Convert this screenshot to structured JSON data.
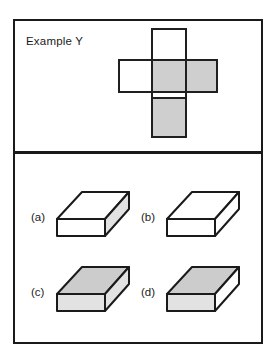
{
  "figure": {
    "title": "Example Y",
    "panels": {
      "top_label": "Example Y"
    }
  },
  "net": {
    "description": "unfolded-box-net",
    "faces": [
      {
        "id": "top-flap",
        "shade": "white",
        "x": 33,
        "y": 0,
        "w": 36,
        "h": 33
      },
      {
        "id": "left-flap",
        "shade": "white",
        "x": 0,
        "y": 31,
        "w": 36,
        "h": 33
      },
      {
        "id": "center-face",
        "shade": "gray",
        "x": 33,
        "y": 31,
        "w": 36,
        "h": 33
      },
      {
        "id": "right-flap",
        "shade": "gray",
        "x": 66,
        "y": 31,
        "w": 34,
        "h": 33
      },
      {
        "id": "bottom-face",
        "shade": "gray",
        "x": 33,
        "y": 69,
        "w": 36,
        "h": 41
      }
    ]
  },
  "options": [
    {
      "key": "a",
      "label": "(a)",
      "top_shade": "white",
      "front_shade": "white",
      "side_shade": "lgray"
    },
    {
      "key": "b",
      "label": "(b)",
      "top_shade": "white",
      "front_shade": "white",
      "side_shade": "white"
    },
    {
      "key": "c",
      "label": "(c)",
      "top_shade": "gray",
      "front_shade": "lgray",
      "side_shade": "lgray"
    },
    {
      "key": "d",
      "label": "(d)",
      "top_shade": "gray",
      "front_shade": "lgray",
      "side_shade": "white"
    }
  ],
  "colors": {
    "ink": "#1a1a1a",
    "shade_gray": "#cccccc",
    "shade_light_gray": "#e2e2e2",
    "white": "#ffffff"
  }
}
